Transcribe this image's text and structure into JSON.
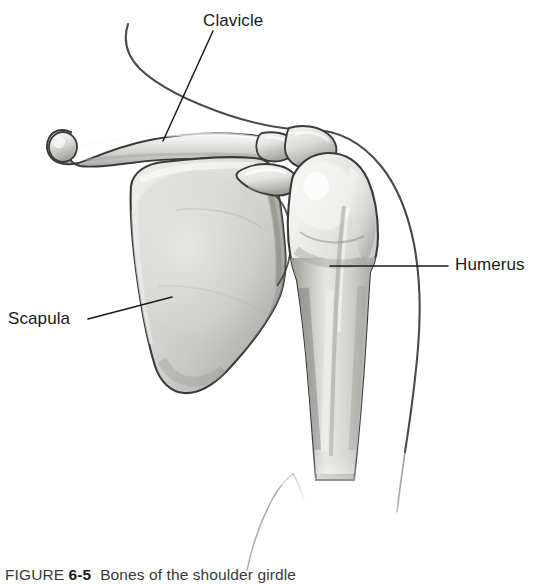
{
  "figure": {
    "caption_prefix": "FIGURE",
    "caption_number": "6-5",
    "caption_text": "Bones of the shoulder girdle",
    "background_color": "#ffffff",
    "line_color": "#3a3a3a",
    "bone_fill_light": "#f2f2f0",
    "bone_fill_mid": "#c9c9c6",
    "bone_fill_dark": "#9a9a97",
    "leader_color": "#1a1a1a"
  },
  "labels": [
    {
      "id": "clavicle",
      "text": "Clavicle",
      "leader": {
        "x1": 213,
        "y1": 31,
        "x2": 163,
        "y2": 141
      }
    },
    {
      "id": "humerus",
      "text": "Humerus",
      "leader": {
        "x1": 448,
        "y1": 266,
        "x2": 330,
        "y2": 266
      }
    },
    {
      "id": "scapula",
      "text": "Scapula",
      "leader": {
        "x1": 88,
        "y1": 319,
        "x2": 172,
        "y2": 297
      }
    }
  ],
  "structures": [
    {
      "id": "clavicle-bone",
      "name": "Clavicle"
    },
    {
      "id": "scapula-bone",
      "name": "Scapula"
    },
    {
      "id": "humerus-bone",
      "name": "Humerus"
    },
    {
      "id": "acromion",
      "name": "Acromion process"
    },
    {
      "id": "coracoid",
      "name": "Coracoid process"
    },
    {
      "id": "body-contour-upper",
      "name": "Neck and shoulder contour"
    },
    {
      "id": "body-contour-arm",
      "name": "Arm contour"
    },
    {
      "id": "body-contour-lower",
      "name": "Torso contour"
    }
  ]
}
